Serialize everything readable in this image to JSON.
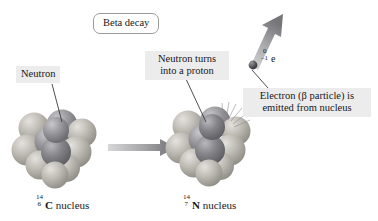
{
  "figure": {
    "title_box": "Beta decay",
    "background_color": "#ffffff",
    "callout_background": "#ececed"
  },
  "labels": {
    "neutron": "Neutron",
    "neutron_turns_proton": "Neutron turns into a proton",
    "electron_emitted": "Electron (β particle) is emitted from nucleus"
  },
  "electron": {
    "mass_number": "0",
    "charge_number": "–1",
    "symbol": "e"
  },
  "nuclei": [
    {
      "name": "carbon-14-nucleus",
      "mass_number": "14",
      "atomic_number": "6",
      "symbol": "C",
      "caption_suffix": " nucleus",
      "proton_color": "#8d8d90",
      "neutron_color": "#b5b3ae",
      "highlight_color": "#6f6f72"
    },
    {
      "name": "nitrogen-14-nucleus",
      "mass_number": "14",
      "atomic_number": "7",
      "symbol": "N",
      "caption_suffix": " nucleus",
      "proton_color": "#8a8a8d",
      "neutron_color": "#aeaca7",
      "highlight_color": "#6a6a6d"
    }
  ],
  "arrows": {
    "transformation_arrow": "transformation-arrow",
    "emission_arrow": "electron-emission-arrow",
    "color": "#8e8e91"
  }
}
